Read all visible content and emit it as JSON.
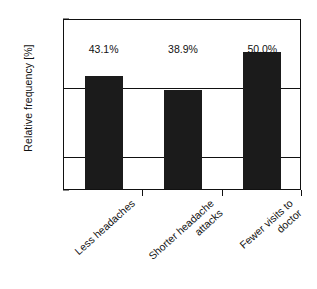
{
  "chart_data": {
    "type": "bar",
    "title": "",
    "xlabel": "",
    "ylabel": "Relative frequency [%]",
    "ylim": [
      10,
      60
    ],
    "yticks": [
      10,
      20,
      40,
      60
    ],
    "ytick_labels": [
      "10",
      "20",
      "40",
      "60"
    ],
    "gridlines": [
      20,
      40
    ],
    "grid": true,
    "legend": "none",
    "bar_color": "#1b1b1b",
    "categories": [
      "Less headaches",
      "Shorter headache attacks",
      "Fewer visits to doctor"
    ],
    "category_lines": [
      [
        "Less headaches"
      ],
      [
        "Shorter headache",
        "attacks"
      ],
      [
        "Fewer visits to",
        "doctor"
      ]
    ],
    "values": [
      43.1,
      38.9,
      50.0
    ],
    "value_labels": [
      "43.1%",
      "38.9%",
      "50.0%"
    ]
  },
  "caption": {
    "text": ""
  }
}
